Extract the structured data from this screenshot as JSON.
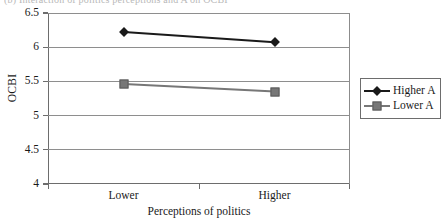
{
  "figure": {
    "caption_sliver": "(b) Interaction of politics perceptions and A on OCBI"
  },
  "colors": {
    "series_higher": "#1a1a1a",
    "series_lower": "#777777",
    "axis": "#6d6d6d",
    "grid": "#8e8e8e",
    "background": "#ffffff"
  },
  "legend": {
    "position": "right",
    "entries": [
      {
        "label": "Higher A",
        "marker": "diamond",
        "color": "#1a1a1a"
      },
      {
        "label": "Lower A",
        "marker": "square",
        "color": "#777777"
      }
    ]
  },
  "chart_data": {
    "type": "line",
    "title": "",
    "subtitle": "",
    "xlabel": "Perceptions of politics",
    "ylabel": "OCBI",
    "categories": [
      "Lower",
      "Higher"
    ],
    "ylim": [
      4,
      6.5
    ],
    "yticks": [
      4,
      4.5,
      5,
      5.5,
      6,
      6.5
    ],
    "ytick_labels": [
      "4",
      "4.5",
      "5",
      "5.5",
      "6",
      "6.5"
    ],
    "grid": true,
    "grid_axis": "y",
    "legend_position": "right",
    "series": [
      {
        "name": "Higher A",
        "marker": "diamond",
        "color": "#1a1a1a",
        "values": [
          6.22,
          6.07
        ]
      },
      {
        "name": "Lower A",
        "marker": "square",
        "color": "#777777",
        "values": [
          5.46,
          5.35
        ]
      }
    ]
  }
}
